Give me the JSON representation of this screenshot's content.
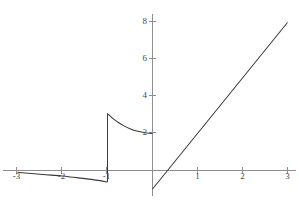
{
  "figure": {
    "width": 299,
    "height": 202,
    "background": "#ffffff",
    "curve_color": "#3a3a3c",
    "axis_color": "#8e8e90",
    "label_color": "#4a4a4c"
  },
  "axes": {
    "x_axis_name": "x-axis",
    "y_axis_name": "y-axis",
    "x_tick_labels": [
      "-3",
      "-2",
      "-1",
      "1",
      "2",
      "3"
    ],
    "x_tick_values": [
      -3,
      -2,
      -1,
      1,
      2,
      3
    ],
    "y_tick_labels": [
      "2",
      "4",
      "6",
      "8"
    ],
    "y_tick_values": [
      2,
      4,
      6,
      8
    ]
  },
  "chart_data": {
    "type": "line",
    "title": "",
    "subtitle": "",
    "xlabel": "",
    "ylabel": "",
    "xlim": [
      -3.35,
      3.25
    ],
    "ylim": [
      -1.65,
      8.6
    ],
    "grid": false,
    "legend": null,
    "legend_position": "none",
    "annotations": [],
    "series": [
      {
        "name": "branch-left",
        "domain": [
          -3,
          -1
        ],
        "points": [
          [
            -3.0,
            -0.1
          ],
          [
            -2.75,
            -0.15
          ],
          [
            -2.5,
            -0.2
          ],
          [
            -2.25,
            -0.25
          ],
          [
            -2.0,
            -0.3
          ],
          [
            -1.75,
            -0.37
          ],
          [
            -1.5,
            -0.44
          ],
          [
            -1.25,
            -0.52
          ],
          [
            -1.0,
            -0.62
          ]
        ]
      },
      {
        "name": "jump-at-minus-one",
        "domain": [
          -1,
          -1
        ],
        "points": [
          [
            -1.0,
            -0.62
          ],
          [
            -1.0,
            3.08
          ]
        ]
      },
      {
        "name": "branch-middle-decay",
        "domain": [
          -1,
          0
        ],
        "points": [
          [
            -1.0,
            3.08
          ],
          [
            -0.875,
            2.8
          ],
          [
            -0.75,
            2.58
          ],
          [
            -0.625,
            2.4
          ],
          [
            -0.5,
            2.26
          ],
          [
            -0.375,
            2.15
          ],
          [
            -0.25,
            2.08
          ],
          [
            -0.125,
            2.03
          ],
          [
            0.0,
            2.0
          ]
        ]
      },
      {
        "name": "branch-right-linear",
        "domain": [
          0,
          3
        ],
        "points": [
          [
            0.0,
            -1.0
          ],
          [
            1.0,
            2.0
          ],
          [
            2.0,
            5.0
          ],
          [
            3.0,
            8.0
          ]
        ]
      }
    ]
  }
}
